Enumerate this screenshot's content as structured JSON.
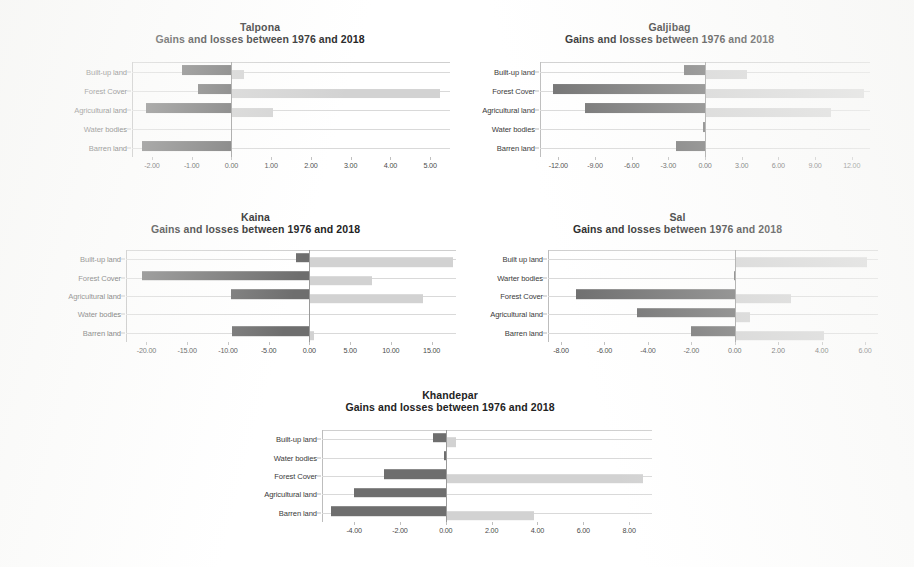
{
  "figure": {
    "subtitle_common": "Gains and losses between 1976 and 2018",
    "series_names": [
      "Loss",
      "Gain"
    ],
    "colors": {
      "loss": "#6e6e6e",
      "gain": "#d2d2d2",
      "gridline": "#d9d9d9",
      "axis": "#bdbdbd",
      "text": "#2b2b2b"
    }
  },
  "chart_data": [
    {
      "id": "talpona",
      "type": "bar",
      "orientation": "horizontal",
      "title": "Talpona",
      "subtitle": "Gains and losses between 1976 and 2018",
      "xlabel": "",
      "ylabel": "",
      "grid": true,
      "legend": "none",
      "categories": [
        "Built-up land",
        "Forest Cover",
        "Agricultural land",
        "Water bodies",
        "Barren land"
      ],
      "xlim": [
        -2.5,
        5.5
      ],
      "xticks": [
        -2,
        -1,
        0,
        1,
        2,
        3,
        4,
        5
      ],
      "xticklabels": [
        "-2.00",
        "-1.00",
        "0.00",
        "1.00",
        "2.00",
        "3.00",
        "4.00",
        "5.00"
      ],
      "series": [
        {
          "name": "Loss",
          "values": [
            -1.25,
            -0.85,
            -2.15,
            -0.02,
            -2.25
          ]
        },
        {
          "name": "Gain",
          "values": [
            0.33,
            5.25,
            1.05,
            0.0,
            0.0
          ]
        }
      ]
    },
    {
      "id": "galjibag",
      "type": "bar",
      "orientation": "horizontal",
      "title": "Galjibag",
      "subtitle": "Gains and losses between 1976 and 2018",
      "xlabel": "",
      "ylabel": "",
      "grid": true,
      "legend": "none",
      "categories": [
        "Built-up land",
        "Forest Cover",
        "Agricultural land",
        "Water bodies",
        "Barren land"
      ],
      "xlim": [
        -13.5,
        13.5
      ],
      "xticks": [
        -12,
        -9,
        -6,
        -3,
        0,
        3,
        6,
        9,
        12
      ],
      "xticklabels": [
        "-12.00",
        "-9.00",
        "-6.00",
        "-3.00",
        "0.00",
        "3.00",
        "6.00",
        "9.00",
        "12.00"
      ],
      "series": [
        {
          "name": "Loss",
          "values": [
            -1.7,
            -12.4,
            -9.8,
            -0.15,
            -2.4
          ]
        },
        {
          "name": "Gain",
          "values": [
            3.4,
            13.0,
            10.3,
            0.0,
            0.0
          ]
        }
      ]
    },
    {
      "id": "kaina",
      "type": "bar",
      "orientation": "horizontal",
      "title": "Kaina",
      "subtitle": "Gains and losses between 1976 and 2018",
      "xlabel": "",
      "ylabel": "",
      "grid": true,
      "legend": "none",
      "categories": [
        "Built-up land",
        "Forest Cover",
        "Agricultural land",
        "Water bodies",
        "Barren land"
      ],
      "xlim": [
        -22.5,
        18.0
      ],
      "xticks": [
        -20,
        -15,
        -10,
        -5,
        0,
        5,
        10,
        15
      ],
      "xticklabels": [
        "-20.00",
        "-15.00",
        "-10.00",
        "-5.00",
        "0.00",
        "5.00",
        "10.00",
        "15.00"
      ],
      "series": [
        {
          "name": "Loss",
          "values": [
            -1.6,
            -20.6,
            -9.6,
            -0.1,
            -9.5
          ]
        },
        {
          "name": "Gain",
          "values": [
            17.6,
            7.7,
            13.9,
            0.0,
            0.6
          ]
        }
      ]
    },
    {
      "id": "sal",
      "type": "bar",
      "orientation": "horizontal",
      "title": "Sal",
      "subtitle": "Gains and losses between 1976 and 2018",
      "xlabel": "",
      "ylabel": "",
      "grid": true,
      "legend": "none",
      "categories": [
        "Built up land",
        "Warter bodies",
        "Forest Cover",
        "Agricultural land",
        "Barren land"
      ],
      "xlim": [
        -8.6,
        6.6
      ],
      "xticks": [
        -8,
        -6,
        -4,
        -2,
        0,
        2,
        4,
        6
      ],
      "xticklabels": [
        "-8.00",
        "-6.00",
        "-4.00",
        "-2.00",
        "0.00",
        "2.00",
        "4.00",
        "6.00"
      ],
      "series": [
        {
          "name": "Loss",
          "values": [
            0.0,
            -0.05,
            -7.3,
            -4.5,
            -2.0
          ]
        },
        {
          "name": "Gain",
          "values": [
            6.1,
            0.0,
            2.6,
            0.7,
            4.1
          ]
        }
      ]
    },
    {
      "id": "khandepar",
      "type": "bar",
      "orientation": "horizontal",
      "title": "Khandepar",
      "subtitle": "Gains and losses between 1976 and 2018",
      "xlabel": "",
      "ylabel": "",
      "grid": true,
      "legend": "none",
      "categories": [
        "Built-up land",
        "Water bodies",
        "Forest Cover",
        "Agricultural land",
        "Barren land"
      ],
      "xlim": [
        -5.4,
        9.0
      ],
      "xticks": [
        -4,
        -2,
        0,
        2,
        4,
        6,
        8
      ],
      "xticklabels": [
        "-4.00",
        "-2.00",
        "0.00",
        "2.00",
        "4.00",
        "6.00",
        "8.00"
      ],
      "series": [
        {
          "name": "Loss",
          "values": [
            -0.55,
            -0.06,
            -2.7,
            -4.0,
            -5.0
          ]
        },
        {
          "name": "Gain",
          "values": [
            0.45,
            0.0,
            8.6,
            0.0,
            3.85
          ]
        }
      ]
    }
  ],
  "layout": {
    "panels": [
      {
        "id": "talpona",
        "left": 60,
        "top": 22,
        "width": 400,
        "height": 165,
        "plot_left": 72,
        "plot_top": 40,
        "plot_w": 318,
        "plot_h": 95
      },
      {
        "id": "galjibag",
        "left": 462,
        "top": 22,
        "width": 415,
        "height": 165,
        "plot_left": 78,
        "plot_top": 40,
        "plot_w": 330,
        "plot_h": 95
      },
      {
        "id": "kaina",
        "left": 48,
        "top": 212,
        "width": 415,
        "height": 160,
        "plot_left": 78,
        "plot_top": 38,
        "plot_w": 330,
        "plot_h": 92
      },
      {
        "id": "sal",
        "left": 470,
        "top": 212,
        "width": 415,
        "height": 160,
        "plot_left": 78,
        "plot_top": 38,
        "plot_w": 330,
        "plot_h": 92
      },
      {
        "id": "khandepar",
        "left": 240,
        "top": 390,
        "width": 420,
        "height": 165,
        "plot_left": 82,
        "plot_top": 40,
        "plot_w": 330,
        "plot_h": 92
      }
    ]
  }
}
